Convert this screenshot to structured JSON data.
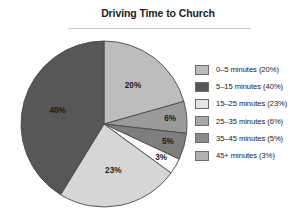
{
  "chart_data": {
    "type": "pie",
    "title": "Driving Time to Church",
    "xlabel": "",
    "ylabel": "",
    "legend_position": "right",
    "grid": false,
    "categories": [
      "0–5 minutes",
      "5–15 minutes",
      "15–25 minutes",
      "25–35 minutes",
      "35–45 minutes",
      "45+ minutes"
    ],
    "values": [
      20,
      40,
      23,
      6,
      5,
      3
    ],
    "value_unit": "%",
    "slice_labels": [
      "20%",
      "40%",
      "23%",
      "6%",
      "5%",
      "3%"
    ],
    "legend_entries": [
      "0–5 minutes (20%)",
      "5–15 minutes (40%)",
      "15–25 minutes (23%)",
      "25–35 minutes (6%)",
      "35–45 minutes (5%)",
      "45+ minutes (3%)"
    ],
    "legend_swatch_colors": [
      "#bdbdbd",
      "#575757",
      "#e4e4e4",
      "#a8a8a8",
      "#8a8a8a",
      "#b0b0b0"
    ],
    "slice_colors": [
      "#bdbdbd",
      "#575757",
      "#d6d6d6",
      "#9a9a9a",
      "#7e7e7e",
      "#fefefe"
    ],
    "slice_order_clockwise_from_top": [
      "0–5 minutes",
      "25–35 minutes",
      "35–45 minutes",
      "45+ minutes",
      "15–25 minutes",
      "5–15 minutes"
    ],
    "start_angle_deg": 0,
    "outline_color": "#4a4a4a"
  },
  "title": {
    "text": "Driving Time to Church"
  }
}
